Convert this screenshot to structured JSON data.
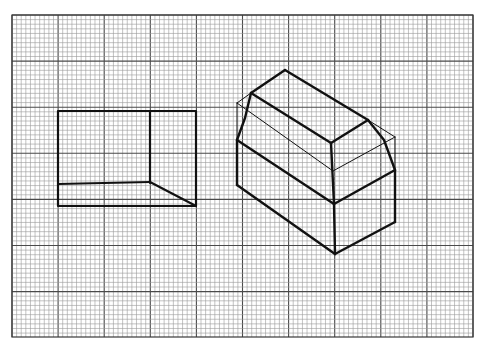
{
  "figure": {
    "background": "#ffffff",
    "grid": {
      "x0": 12,
      "y0": 15,
      "x1": 473,
      "y1": 337,
      "minor_step": 4.61,
      "major_every": 10,
      "minor_color": "#9a9a9a",
      "major_color": "#4a4a4a",
      "border_color": "#3a3a3a"
    },
    "ink_color": "#111111",
    "top_view": {
      "label": "top-view",
      "outer": [
        [
          58,
          111
        ],
        [
          196,
          111
        ],
        [
          196,
          206
        ],
        [
          58,
          206
        ]
      ],
      "lines": [
        [
          [
            150,
            111
          ],
          [
            150,
            183
          ]
        ],
        [
          [
            58,
            184
          ],
          [
            150,
            182
          ]
        ],
        [
          [
            150,
            182
          ],
          [
            196,
            206
          ]
        ]
      ]
    },
    "isometric_view": {
      "label": "isometric-view",
      "thick_lines": [
        [
          [
            285,
            70
          ],
          [
            251,
            93
          ]
        ],
        [
          [
            285,
            70
          ],
          [
            368,
            120
          ]
        ],
        [
          [
            251,
            93
          ],
          [
            331,
            143
          ]
        ],
        [
          [
            331,
            143
          ],
          [
            368,
            120
          ]
        ],
        [
          [
            251,
            93
          ],
          [
            245,
            118
          ],
          [
            237,
            140
          ]
        ],
        [
          [
            368,
            120
          ],
          [
            384,
            140
          ],
          [
            395,
            170
          ]
        ],
        [
          [
            331,
            143
          ],
          [
            334,
            204
          ]
        ],
        [
          [
            237,
            140
          ],
          [
            334,
            204
          ]
        ],
        [
          [
            334,
            204
          ],
          [
            395,
            170
          ]
        ],
        [
          [
            237,
            140
          ],
          [
            237,
            185
          ]
        ],
        [
          [
            237,
            185
          ],
          [
            335,
            254
          ]
        ],
        [
          [
            334,
            204
          ],
          [
            335,
            254
          ]
        ],
        [
          [
            335,
            254
          ],
          [
            395,
            222
          ]
        ],
        [
          [
            395,
            170
          ],
          [
            395,
            222
          ]
        ]
      ],
      "thin_lines": [
        [
          [
            237,
            103
          ],
          [
            251,
            93
          ]
        ],
        [
          [
            237,
            103
          ],
          [
            237,
            140
          ]
        ],
        [
          [
            237,
            103
          ],
          [
            333,
            171
          ]
        ],
        [
          [
            333,
            171
          ],
          [
            395,
            137
          ]
        ],
        [
          [
            395,
            137
          ],
          [
            368,
            120
          ]
        ],
        [
          [
            395,
            137
          ],
          [
            395,
            170
          ]
        ]
      ]
    }
  }
}
